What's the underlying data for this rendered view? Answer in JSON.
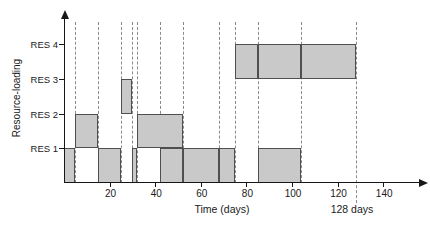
{
  "figure": {
    "background": "#ffffff",
    "bar_fill": "#c9c9c9",
    "bar_border": "#4f4f4f",
    "dashed_line_color": "#8a8a8a",
    "axis_color": "#161616"
  },
  "chart_data": {
    "type": "bar",
    "subtype": "resource-loading-gantt",
    "title": "",
    "xlabel": "Time (days)",
    "ylabel": "Resource-loading",
    "xlim": [
      0,
      157
    ],
    "grid": "vertical-dashed-event-lines",
    "legend": "none",
    "x_ticks": [
      {
        "day": 20,
        "label": "20"
      },
      {
        "day": 40,
        "label": "40"
      },
      {
        "day": 60,
        "label": "60"
      },
      {
        "day": 80,
        "label": "80"
      },
      {
        "day": 100,
        "label": "100"
      },
      {
        "day": 120,
        "label": "120"
      },
      {
        "day": 140,
        "label": "140"
      }
    ],
    "y_categories": [
      {
        "row": 1,
        "label": "RES 1"
      },
      {
        "row": 2,
        "label": "RES 2"
      },
      {
        "row": 3,
        "label": "RES 3"
      },
      {
        "row": 4,
        "label": "RES 4"
      }
    ],
    "dashed_event_days": [
      5,
      15,
      25,
      30,
      32,
      42,
      52,
      68,
      75,
      85,
      104,
      128
    ],
    "completion_annotation": {
      "day": 128,
      "label": "128 days"
    },
    "series": [
      {
        "name": "RES 1",
        "row": 1,
        "intervals": [
          [
            0,
            5
          ],
          [
            15,
            25
          ],
          [
            30,
            32
          ],
          [
            42,
            52
          ],
          [
            52,
            68
          ],
          [
            68,
            75
          ],
          [
            85,
            104
          ]
        ]
      },
      {
        "name": "RES 2",
        "row": 2,
        "intervals": [
          [
            5,
            15
          ],
          [
            32,
            52
          ]
        ]
      },
      {
        "name": "RES 3",
        "row": 3,
        "intervals": [
          [
            25,
            30
          ]
        ]
      },
      {
        "name": "RES 4",
        "row": 4,
        "intervals": [
          [
            75,
            85
          ],
          [
            85,
            104
          ],
          [
            104,
            128
          ]
        ]
      }
    ]
  }
}
